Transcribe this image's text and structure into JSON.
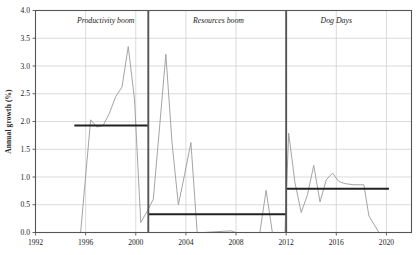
{
  "chart_data": {
    "type": "line",
    "title": "",
    "subtitle": "",
    "xlabel": "",
    "ylabel": "Annual growth (%)",
    "xlim": [
      1992,
      2022
    ],
    "ylim": [
      0.0,
      4.0
    ],
    "grid": true,
    "legend_position": "none",
    "y_ticks": [
      "0.0",
      "0.5",
      "1.0",
      "1.5",
      "2.0",
      "2.5",
      "3.0",
      "3.5",
      "4.0"
    ],
    "y_tick_values": [
      0.0,
      0.5,
      1.0,
      1.5,
      2.0,
      2.5,
      3.0,
      3.5,
      4.0
    ],
    "x_ticks": [
      "1992",
      "1996",
      "2000",
      "2004",
      "2008",
      "2012",
      "2016",
      "2020"
    ],
    "x_tick_values": [
      1992,
      1996,
      2000,
      2004,
      2008,
      2012,
      2016,
      2020
    ],
    "series": [
      {
        "name": "Annual growth",
        "color": "#9a9a9a",
        "type": "line",
        "x": [
          1994.6,
          1995.6,
          1996.4,
          1996.9,
          1997.4,
          1997.9,
          1998.4,
          1998.9,
          1999.4,
          1999.9,
          2000.4,
          2000.9,
          2001.4,
          2001.9,
          2002.4,
          2002.9,
          2003.4,
          2003.9,
          2004.4,
          2004.9,
          2005.4,
          2007.6,
          2008.0,
          2009.9,
          2010.4,
          2010.9,
          2011.4,
          2011.9,
          2012.2,
          2012.7,
          2013.2,
          2013.7,
          2014.2,
          2014.7,
          2015.2,
          2015.7,
          2016.2,
          2016.7,
          2017.4,
          2018.2,
          2018.6,
          2019.4
        ],
        "values": [
          0.0,
          0.0,
          2.03,
          1.9,
          1.93,
          2.15,
          2.45,
          2.62,
          3.35,
          2.4,
          0.18,
          0.38,
          0.6,
          1.9,
          3.21,
          1.6,
          0.5,
          1.05,
          1.62,
          0.0,
          0.0,
          0.03,
          0.0,
          0.0,
          0.76,
          0.0,
          0.0,
          0.0,
          1.79,
          0.9,
          0.36,
          0.68,
          1.21,
          0.55,
          0.95,
          1.07,
          0.92,
          0.88,
          0.86,
          0.86,
          0.3,
          0.0
        ]
      }
    ],
    "segments": [
      {
        "label": "Productivity boom",
        "start_year": 1994.6,
        "end_year": 2001.0,
        "average": 1.93,
        "average_line_start": 1995.1,
        "average_line_end": 2001.0,
        "divider_year": 2001.0,
        "label_x": 1997.6,
        "color": "#222222"
      },
      {
        "label": "Resources boom",
        "start_year": 2001.0,
        "end_year": 2012.0,
        "average": 0.33,
        "average_line_start": 2001.0,
        "average_line_end": 2012.0,
        "divider_year": 2012.0,
        "label_x": 2006.6,
        "color": "#222222"
      },
      {
        "label": "Dog Days",
        "start_year": 2012.0,
        "end_year": 2020.2,
        "average": 0.79,
        "average_line_start": 2012.0,
        "average_line_end": 2020.2,
        "divider_year": null,
        "label_x": 2016.0,
        "color": "#222222"
      }
    ],
    "colors": {
      "series_line": "#9a9a9a",
      "average_line": "#222222",
      "divider_line": "#555555",
      "grid": "#cccccc",
      "axis": "#555555",
      "text": "#1c1c1c"
    }
  }
}
